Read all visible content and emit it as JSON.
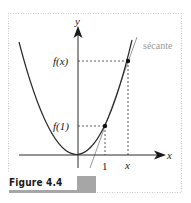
{
  "figure": {
    "caption": "Figure 4.4",
    "axes": {
      "x_label": "x",
      "y_label": "y"
    },
    "ticks": {
      "x": [
        "1",
        "x"
      ],
      "y": [
        "f(1)",
        "f(x)"
      ]
    },
    "annotations": {
      "secant_label": "sécante"
    },
    "colors": {
      "curve": "#2a2a2a",
      "secant": "#9a9a9a",
      "guides": "#333333",
      "frame": "#c8c8c8",
      "caption_bar": "#a6a6a6"
    },
    "curve": {
      "type": "parabola",
      "expression": "y = f(x)",
      "points": [
        {
          "name": "P1",
          "at": "(1, f(1))"
        },
        {
          "name": "Px",
          "at": "(x, f(x))"
        }
      ]
    }
  }
}
